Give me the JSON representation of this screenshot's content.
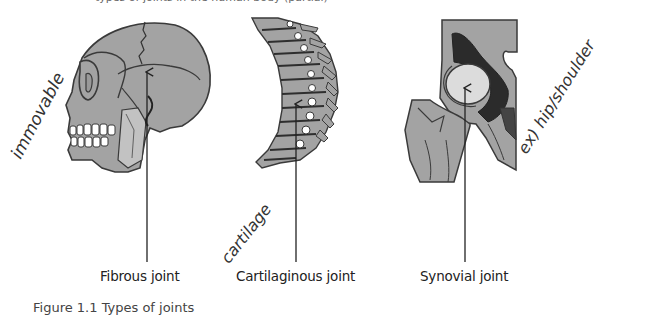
{
  "figure": {
    "caption": "Figure 1.1 Types of joints",
    "top_cut_text": "types of joints in the human body (partial)",
    "colors": {
      "bone_fill": "#a3a3a3",
      "bone_stroke": "#3a3a3a",
      "cartilage_dark": "#2b2b2b",
      "joint_head": "#dcdcdc",
      "arrow": "#222222",
      "background": "#ffffff"
    },
    "joints": [
      {
        "label": "Fibrous joint",
        "illustration": "skull-side-view",
        "annotation": "immovable",
        "arrow_x": 147
      },
      {
        "label": "Cartilaginous joint",
        "illustration": "vertebral-column",
        "annotation": "cartilage",
        "arrow_x": 296
      },
      {
        "label": "Synovial joint",
        "illustration": "hip-joint",
        "annotation": "ex) hip/shoulder",
        "arrow_x": 465
      }
    ]
  }
}
